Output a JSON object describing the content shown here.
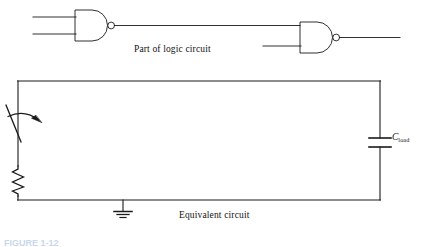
{
  "figure": {
    "domain": "Diagram",
    "kind": "electronic-circuit-schematic",
    "background_color": "#ffffff",
    "line_color": "#1a1a1a",
    "width": 421,
    "height": 247
  },
  "captions": {
    "logic_circuit": "Part of logic circuit",
    "equivalent_circuit": "Equivalent circuit",
    "figure_number": "FIGURE 1-12"
  },
  "labels": {
    "capacitor_symbol": "C",
    "capacitor_subscript": "load"
  },
  "logic_section": {
    "gate_type": "NAND",
    "gates": [
      {
        "name": "nand-gate-left",
        "body_left": 75,
        "body_top": 10,
        "body_bottom": 41,
        "body_right": 92,
        "arc_tip_x": 108,
        "bubble_cx": 111.5,
        "bubble_cy": 25.5,
        "bubble_r": 3.5,
        "inputs": [
          {
            "name": "input-a",
            "x1": 33,
            "y": 17,
            "x2": 75
          },
          {
            "name": "input-b",
            "x1": 33,
            "y": 34,
            "x2": 75
          }
        ],
        "output": {
          "name": "output",
          "x1": 115,
          "y": 25.5,
          "x2": 300
        }
      },
      {
        "name": "nand-gate-right",
        "body_left": 300,
        "body_top": 22,
        "body_bottom": 53,
        "body_right": 317,
        "arc_tip_x": 333,
        "bubble_cx": 336.5,
        "bubble_cy": 37.5,
        "bubble_r": 3.5,
        "inputs": [
          {
            "name": "input-a",
            "x1": 300,
            "y": 29.5,
            "x2": 300
          },
          {
            "name": "input-b",
            "x1": 263,
            "y": 46,
            "x2": 300
          }
        ],
        "output": {
          "name": "output",
          "x1": 340,
          "y": 37.5,
          "x2": 400
        }
      }
    ]
  },
  "equivalent_section": {
    "loop": {
      "left_x": 18,
      "right_x": 380,
      "top_y": 81,
      "bottom_y": 200
    },
    "components": [
      {
        "name": "switch",
        "type": "spst-switch",
        "wire_x": 18,
        "blade_top_x": 6,
        "blade_top_y": 105,
        "blade_bottom_x": 20,
        "blade_bottom_y": 142,
        "arrow": {
          "from_x": 8,
          "from_y": 116,
          "to_x": 40,
          "to_y": 120
        }
      },
      {
        "name": "resistor",
        "type": "zigzag-resistor",
        "x": 18,
        "top_y": 166,
        "bottom_y": 196,
        "zig_width": 6,
        "segments": 6
      },
      {
        "name": "capacitor",
        "type": "parallel-plate-capacitor",
        "x": 380,
        "plate_half_width": 11,
        "top_plate_y": 138,
        "bottom_plate_y": 147
      },
      {
        "name": "ground",
        "type": "earth-ground",
        "x": 123,
        "stem_top_y": 200,
        "stem_bottom_y": 211,
        "bars": [
          {
            "half_width": 9,
            "y": 211
          },
          {
            "half_width": 6,
            "y": 214
          },
          {
            "half_width": 3,
            "y": 217
          }
        ]
      }
    ]
  }
}
